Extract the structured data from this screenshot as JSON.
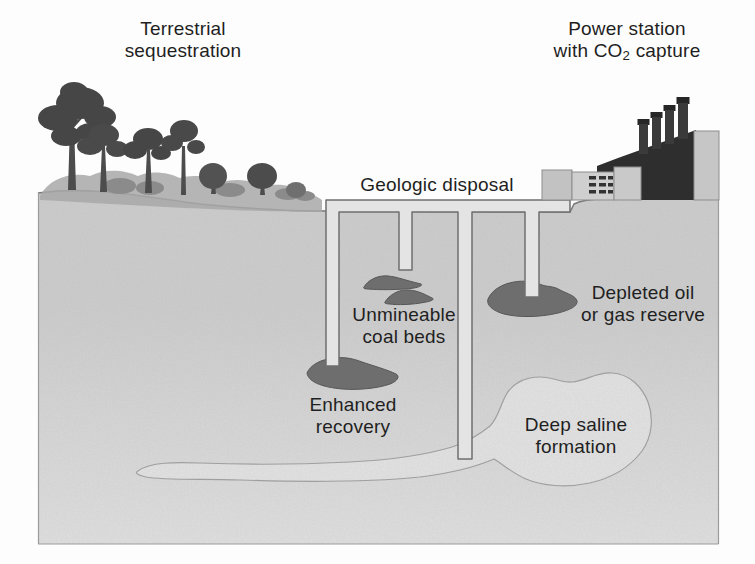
{
  "diagram": {
    "regions": {
      "terrestrial": {
        "line1": "Terrestrial",
        "line2": "sequestration"
      },
      "power_station": {
        "line1": "Power station",
        "line2_pre": "with CO",
        "line2_sub": "2",
        "line2_post": " capture"
      },
      "geologic_disposal": {
        "label": "Geologic disposal"
      },
      "unmineable_coal_beds": {
        "line1": "Unmineable",
        "line2": "coal beds"
      },
      "enhanced_recovery": {
        "line1": "Enhanced",
        "line2": "recovery"
      },
      "depleted_oil_gas": {
        "line1": "Depleted oil",
        "line2": "or gas reserve"
      },
      "deep_saline": {
        "line1": "Deep saline",
        "line2": "formation"
      }
    },
    "colors": {
      "ink": "#1f1f1f",
      "sky": "#fdfdfd",
      "ground": "#d4d4d4",
      "ground_line": "#7a7a7a",
      "pipe_fill": "#e4e4e4",
      "pipe_outline": "#6f6f6f",
      "reservoir_blob": "#6e6e6e",
      "saline_fill": "#e2e2e2",
      "saline_outline": "#9e9e9e",
      "tree_dark": "#464646",
      "bush_light": "#a8a8a8",
      "building_dark": "#2e2e2e",
      "building_light": "#c6c6c6",
      "frame": "#9b9b9b"
    }
  }
}
